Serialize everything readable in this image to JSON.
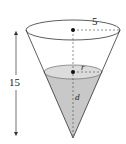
{
  "diagram": {
    "type": "conical-tank",
    "labels": {
      "top_radius": "5",
      "height": "15",
      "water_radius": "r",
      "water_depth": "d"
    },
    "colors": {
      "line": "#333333",
      "water": "#c8c8c8",
      "water_surface": "#dcdcdc",
      "background": "#ffffff"
    }
  }
}
